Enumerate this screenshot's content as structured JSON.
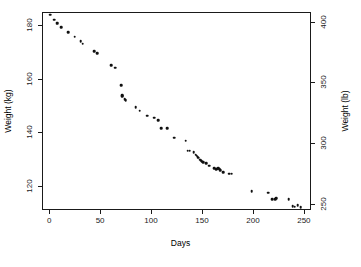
{
  "chart_data": {
    "type": "scatter",
    "title": "",
    "xlabel": "Days",
    "ylabel": "Weight (kg)",
    "ylabel_right": "Weight (lb)",
    "xlim": [
      -7,
      257
    ],
    "ylim": [
      111,
      185
    ],
    "ylim_right": [
      244.7,
      407.9
    ],
    "grid": false,
    "legend": null,
    "marker_color": "#101010",
    "frame_color": "#1a1a1a",
    "background": "#ffffff",
    "xticks": [
      0,
      50,
      100,
      150,
      200,
      250
    ],
    "xticklabels": [
      "0",
      "50",
      "100",
      "150",
      "200",
      "250"
    ],
    "yticks_left": [
      120,
      140,
      160,
      180
    ],
    "yticklabels_left": [
      "120",
      "140",
      "160",
      "180"
    ],
    "yticks_right": [
      250,
      300,
      350,
      400
    ],
    "yticklabels_right": [
      "250",
      "300",
      "350",
      "400"
    ],
    "kg_per_lb": 0.45359237,
    "x": [
      0,
      4,
      7,
      7,
      11,
      18,
      24,
      30,
      32,
      43,
      46,
      60,
      64,
      70,
      71,
      71,
      73,
      74,
      84,
      88,
      95,
      102,
      106,
      109,
      115,
      122,
      133,
      135,
      137,
      141,
      143,
      144,
      145,
      146,
      147,
      148,
      149,
      150,
      153,
      156,
      161,
      163,
      164,
      165,
      166,
      167,
      170,
      176,
      178,
      198,
      214,
      218,
      221,
      222,
      234,
      238,
      240,
      243,
      246
    ],
    "y": [
      184.35,
      182.51,
      181.4,
      180.95,
      179.8,
      177.8,
      176.2,
      174.4,
      173.6,
      170.8,
      169.9,
      165.6,
      164.5,
      158.1,
      154.2,
      153.9,
      152.8,
      152.4,
      149.7,
      148.5,
      146.6,
      145.9,
      144.9,
      142.0,
      141.9,
      138.4,
      137.2,
      133.5,
      133.6,
      133.0,
      132.0,
      131.6,
      131.0,
      130.9,
      130.1,
      129.8,
      129.4,
      129.3,
      128.9,
      127.9,
      127.0,
      126.6,
      126.8,
      127.1,
      126.8,
      126.2,
      125.4,
      125.0,
      124.9,
      118.5,
      117.9,
      115.3,
      115.5,
      115.8,
      115.5,
      112.9,
      112.6,
      113.2,
      112.4
    ]
  },
  "figure": {
    "axis_titles": {
      "x": "Days",
      "y_left": "Weight (kg)",
      "y_right": "Weight (lb)"
    }
  }
}
